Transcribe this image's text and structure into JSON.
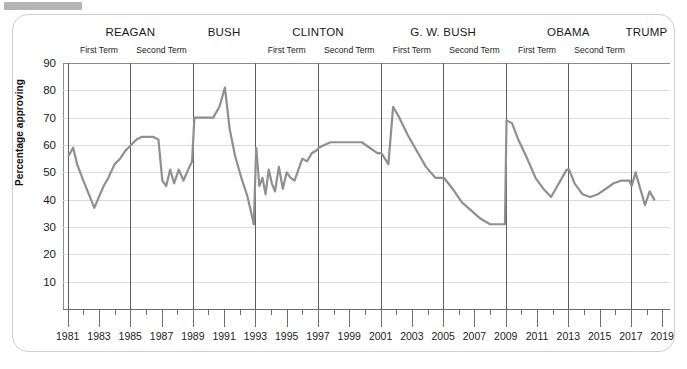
{
  "chart_data": {
    "type": "line",
    "title": "",
    "xlabel": "",
    "ylabel": "Percentage approving",
    "ylim": [
      0,
      90
    ],
    "xlim": [
      1980.7,
      2019.5
    ],
    "yticks": [
      10,
      20,
      30,
      40,
      50,
      60,
      70,
      80,
      90
    ],
    "xticks": [
      1981,
      1983,
      1985,
      1987,
      1989,
      1991,
      1993,
      1995,
      1997,
      1999,
      2001,
      2003,
      2005,
      2007,
      2009,
      2011,
      2013,
      2015,
      2017,
      2019
    ],
    "grid": true,
    "legend": "none",
    "line_color": "#8f8f8f",
    "grid_color": "#dcdcdc",
    "axis_color": "#6f6f6f",
    "series": [
      {
        "name": "Presidential approval",
        "x": [
          1981.05,
          1981.35,
          1981.6,
          1982.0,
          1982.35,
          1982.7,
          1983.0,
          1983.3,
          1983.6,
          1984.0,
          1984.35,
          1984.7,
          1985.05,
          1985.4,
          1985.75,
          1986.1,
          1986.45,
          1986.8,
          1987.05,
          1987.3,
          1987.55,
          1987.8,
          1988.1,
          1988.4,
          1988.7,
          1988.95,
          1989.1,
          1989.5,
          1989.9,
          1990.3,
          1990.7,
          1991.05,
          1991.35,
          1991.7,
          1992.1,
          1992.5,
          1992.9,
          1993.05,
          1993.25,
          1993.45,
          1993.65,
          1993.85,
          1994.05,
          1994.25,
          1994.5,
          1994.75,
          1995.0,
          1995.25,
          1995.5,
          1995.75,
          1996.0,
          1996.3,
          1996.6,
          1996.9,
          1997.05,
          1997.4,
          1997.8,
          1998.2,
          1998.6,
          1999.0,
          1999.4,
          1999.8,
          2000.3,
          2000.8,
          2001.05,
          2001.5,
          2001.8,
          2002.2,
          2002.7,
          2003.3,
          2003.9,
          2004.5,
          2005.05,
          2005.6,
          2006.2,
          2006.8,
          2007.4,
          2008.0,
          2008.6,
          2008.95,
          2009.05,
          2009.4,
          2009.8,
          2010.3,
          2010.9,
          2011.4,
          2011.9,
          2012.4,
          2012.9,
          2013.05,
          2013.4,
          2013.9,
          2014.4,
          2014.9,
          2015.4,
          2015.9,
          2016.4,
          2016.9,
          2017.05,
          2017.3,
          2017.6,
          2017.9,
          2018.2,
          2018.5
        ],
        "y": [
          56,
          59,
          53,
          47,
          42,
          37,
          41,
          45,
          48,
          53,
          55,
          58,
          60,
          62,
          63,
          63,
          63,
          62,
          47,
          45,
          51,
          46,
          51,
          47,
          51,
          54,
          70,
          70,
          70,
          70,
          74,
          81,
          66,
          56,
          48,
          41,
          31,
          59,
          45,
          48,
          42,
          51,
          46,
          43,
          52,
          44,
          50,
          48,
          47,
          51,
          55,
          54,
          57,
          58,
          59,
          60,
          61,
          61,
          61,
          61,
          61,
          61,
          59,
          57,
          57,
          53,
          74,
          70,
          64,
          58,
          52,
          48,
          48,
          44,
          39,
          36,
          33,
          31,
          31,
          31,
          69,
          68,
          62,
          56,
          48,
          44,
          41,
          46,
          51,
          51,
          46,
          42,
          41,
          42,
          44,
          46,
          47,
          47,
          45,
          50,
          44,
          38,
          43,
          40
        ],
        "segments": [
          {
            "president": "REAGAN",
            "start": 1981.0,
            "end": 1989.0
          },
          {
            "president": "BUSH",
            "start": 1989.0,
            "end": 1993.0
          },
          {
            "president": "CLINTON",
            "start": 1993.0,
            "end": 2001.0
          },
          {
            "president": "G. W. BUSH",
            "start": 2001.0,
            "end": 2009.0
          },
          {
            "president": "OBAMA",
            "start": 2009.0,
            "end": 2017.0
          },
          {
            "president": "TRUMP",
            "start": 2017.0,
            "end": 2018.6
          }
        ]
      }
    ],
    "presidents": [
      {
        "name": "REAGAN",
        "start": 1981,
        "end": 1989,
        "terms": [
          "First Term",
          "Second Term"
        ]
      },
      {
        "name": "BUSH",
        "start": 1989,
        "end": 1993,
        "terms": []
      },
      {
        "name": "CLINTON",
        "start": 1993,
        "end": 2001,
        "terms": [
          "First Term",
          "Second Term"
        ]
      },
      {
        "name": "G. W. BUSH",
        "start": 2001,
        "end": 2009,
        "terms": [
          "First Term",
          "Second Term"
        ]
      },
      {
        "name": "OBAMA",
        "start": 2009,
        "end": 2017,
        "terms": [
          "First Term",
          "Second Term"
        ]
      },
      {
        "name": "TRUMP",
        "start": 2017,
        "end": 2019,
        "terms": []
      }
    ],
    "term_dividers": [
      1981,
      1985,
      1989,
      1993,
      1997,
      2001,
      2005,
      2009,
      2013,
      2017
    ]
  }
}
